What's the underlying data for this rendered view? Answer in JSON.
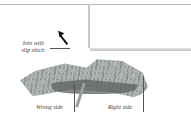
{
  "figure": {
    "labels": {
      "join": "Join with slip stitch",
      "join_line1": "Join with",
      "join_line2": "slip stitch",
      "wrong_side": "Wrong side",
      "right_side": "Right side"
    },
    "colors": {
      "background": "#ffffff",
      "yarn": "#9aa19c",
      "needle": "#c8c8c8",
      "label_text": "#444444",
      "arrow": "#111111"
    }
  }
}
